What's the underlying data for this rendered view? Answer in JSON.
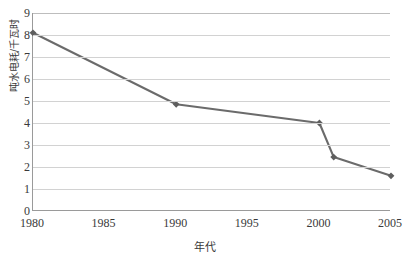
{
  "chart_data": {
    "type": "line",
    "title": "",
    "xlabel": "年代",
    "ylabel": "吨水电耗/千瓦时",
    "xlim": [
      1980,
      2005
    ],
    "ylim": [
      0,
      9
    ],
    "grid": true,
    "legend": "none",
    "line_color": "#6b6b6b",
    "marker": "diamond",
    "marker_color": "#5e5e5e",
    "x": [
      1980,
      1990,
      2000,
      2001,
      2005
    ],
    "values": [
      8.1,
      4.85,
      4.0,
      2.45,
      1.6
    ],
    "points": [
      {
        "x": 1980,
        "y": 8.1
      },
      {
        "x": 1990,
        "y": 4.85
      },
      {
        "x": 2000,
        "y": 4.0
      },
      {
        "x": 2001,
        "y": 2.45
      },
      {
        "x": 2005,
        "y": 1.6
      }
    ],
    "ytick_labels": [
      "9",
      "8",
      "7",
      "6",
      "5",
      "4",
      "3",
      "2",
      "1",
      "0"
    ],
    "ytick_values": [
      9,
      8,
      7,
      6,
      5,
      4,
      3,
      2,
      1,
      0
    ],
    "xtick_labels": [
      "1980",
      "1985",
      "1990",
      "1995",
      "2000",
      "2005"
    ],
    "xtick_values": [
      1980,
      1985,
      1990,
      1995,
      2000,
      2005
    ]
  }
}
